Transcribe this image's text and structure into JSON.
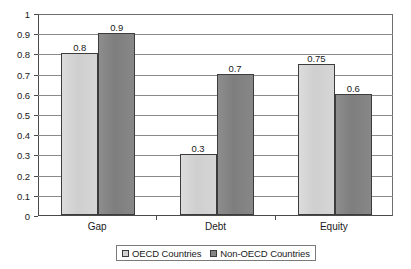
{
  "chart_data": {
    "type": "bar",
    "title": "",
    "subtitle": "",
    "xlabel": "",
    "ylabel": "",
    "categories": [
      "Gap",
      "Debt",
      "Equity"
    ],
    "series": [
      {
        "name": "OECD Countries",
        "color": "#d2d2d2",
        "values": [
          0.8,
          0.3,
          0.75
        ],
        "labels": [
          "0.8",
          "0.3",
          "0.75"
        ]
      },
      {
        "name": "Non-OECD Countries",
        "color": "#858585",
        "values": [
          0.9,
          0.7,
          0.6
        ],
        "labels": [
          "0.9",
          "0.7",
          "0.6"
        ]
      }
    ],
    "ylim": [
      0,
      1
    ],
    "ytick_values": [
      0,
      0.1,
      0.2,
      0.3,
      0.4,
      0.5,
      0.6,
      0.7,
      0.8,
      0.9,
      1
    ],
    "ytick_labels": [
      "0",
      "0.1",
      "0.2",
      "0.3",
      "0.4",
      "0.5",
      "0.6",
      "0.7",
      "0.8",
      "0.9",
      "1"
    ],
    "grid": true,
    "grid_axis": "y",
    "legend_position": "bottom",
    "data_labels": true
  },
  "legend": {
    "entries": [
      {
        "label": "OECD Countries",
        "swatch": "light"
      },
      {
        "label": "Non-OECD Countries",
        "swatch": "dark"
      }
    ]
  },
  "colors": {
    "series_light": "#d2d2d2",
    "series_dark": "#858585",
    "axis": "#4a4a4a",
    "gridline": "#8a8a8a",
    "text": "#1a1a1a",
    "background": "#ffffff"
  }
}
